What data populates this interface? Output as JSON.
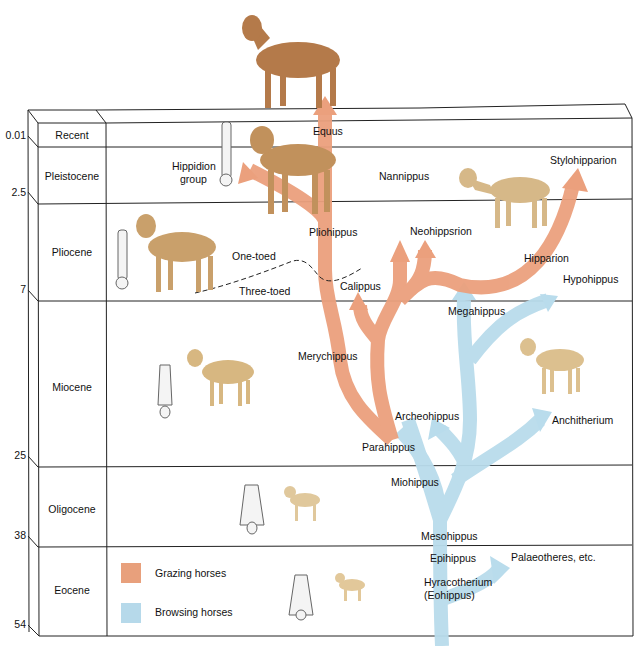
{
  "time_axis": {
    "ages_mya": [
      "0.01",
      "2.5",
      "7",
      "25",
      "38",
      "54"
    ],
    "eras": [
      {
        "name": "Recent"
      },
      {
        "name": "Pleistocene"
      },
      {
        "name": "Pliocene"
      },
      {
        "name": "Miocene"
      },
      {
        "name": "Oligocene"
      },
      {
        "name": "Eocene"
      }
    ]
  },
  "genera": {
    "equus": "Equus",
    "hippidion_line1": "Hippidion",
    "hippidion_line2": "group",
    "nannippus": "Nannippus",
    "stylohipparion": "Stylohipparion",
    "pliohippus": "Pliohippus",
    "neohipparion": "Neohippsrion",
    "hipparion": "Hipparion",
    "hypohippus": "Hypohippus",
    "calippus": "Calippus",
    "megahippus": "Megahippus",
    "merychippus": "Merychippus",
    "archeohippus": "Archeohippus",
    "anchitherium": "Anchitherium",
    "parahippus": "Parahippus",
    "miohippus": "Miohippus",
    "mesohippus": "Mesohippus",
    "epihippus": "Epihippus",
    "palaeotheres": "Palaeotheres, etc.",
    "hyracotherium_line1": "Hyracotherium",
    "hyracotherium_line2": "(Eohippus)"
  },
  "annotations": {
    "one_toed": "One-toed",
    "three_toed": "Three-toed"
  },
  "legend": {
    "items": [
      {
        "label": "Grazing horses",
        "color": "#e8a07c"
      },
      {
        "label": "Browsing horses",
        "color": "#b6d9ea"
      }
    ]
  },
  "colors": {
    "grazing": "#eba07d",
    "browsing": "#b9dcec",
    "line": "#222222"
  }
}
